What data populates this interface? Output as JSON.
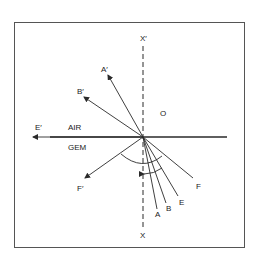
{
  "diagram": {
    "type": "refraction-critical-angle",
    "colors": {
      "line": "#2a2a2a",
      "frame": "#555555",
      "background": "#ffffff"
    },
    "media": {
      "upper": "AIR",
      "lower": "GEM"
    },
    "normal": {
      "top_label": "X′",
      "bottom_label": "X"
    },
    "origin_label": "O",
    "incident_rays": [
      {
        "id": "A",
        "label": "A"
      },
      {
        "id": "B",
        "label": "B"
      },
      {
        "id": "E",
        "label": "E"
      },
      {
        "id": "F",
        "label": "F"
      }
    ],
    "emergent_rays": [
      {
        "id": "A_prime",
        "label": "A′"
      },
      {
        "id": "B_prime",
        "label": "B′"
      },
      {
        "id": "E_prime",
        "label": "E′"
      },
      {
        "id": "F_prime",
        "label": "F′"
      }
    ]
  }
}
